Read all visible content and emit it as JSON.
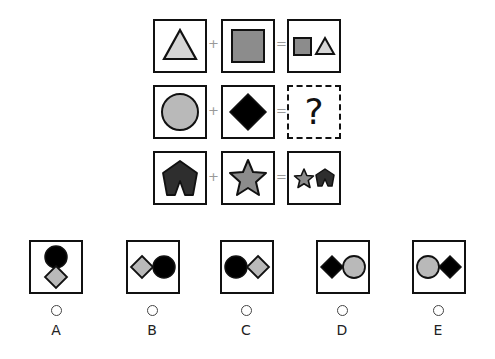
{
  "puzzle": {
    "rows": [
      {
        "operand1": "light-gray-triangle",
        "plus": "+",
        "operand2": "gray-square",
        "equals": "=",
        "result": "gray-square-and-light-gray-triangle"
      },
      {
        "operand1": "light-gray-circle",
        "plus": "+",
        "operand2": "black-diamond",
        "equals": "=",
        "result": "?"
      },
      {
        "operand1": "dark-notched-pentagon",
        "plus": "+",
        "operand2": "gray-star",
        "equals": "=",
        "result": "gray-star-and-dark-notched-pentagon"
      }
    ],
    "question_mark": "?"
  },
  "options": [
    {
      "letter": "A",
      "content": "black-circle-above-gray-diamond"
    },
    {
      "letter": "B",
      "content": "gray-diamond-then-black-circle"
    },
    {
      "letter": "C",
      "content": "black-circle-then-gray-diamond"
    },
    {
      "letter": "D",
      "content": "black-diamond-then-gray-circle"
    },
    {
      "letter": "E",
      "content": "gray-circle-then-black-diamond"
    }
  ],
  "colors": {
    "light_gray": "#d6d6d6",
    "mid_gray": "#8c8c8c",
    "gray_fill": "#b9b9b9",
    "dark": "#2e2e2e",
    "black": "#000000",
    "stroke": "#111111"
  }
}
